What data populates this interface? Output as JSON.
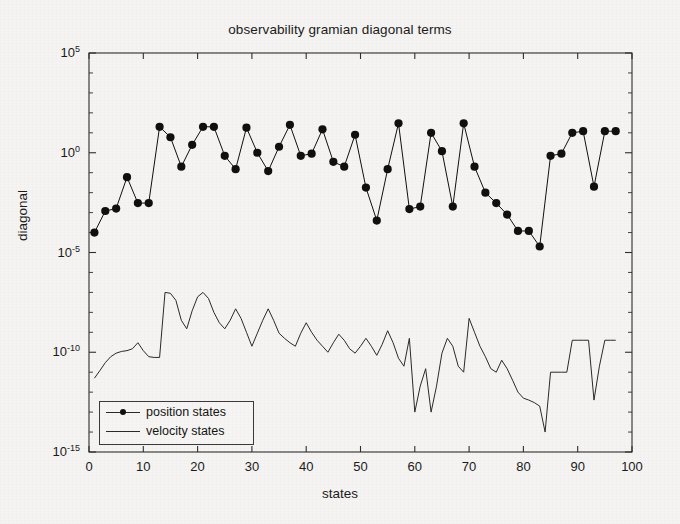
{
  "chart_data": {
    "type": "line",
    "title": "observability gramian diagonal terms",
    "xlabel": "states",
    "ylabel": "diagonal",
    "xlim": [
      0,
      100
    ],
    "ylim": [
      1e-15,
      100000.0
    ],
    "yscale": "log",
    "grid": false,
    "legend_position": "lower left",
    "xticks": [
      0,
      10,
      20,
      30,
      40,
      50,
      60,
      70,
      80,
      90,
      100
    ],
    "xtick_labels": [
      "0",
      "10",
      "20",
      "30",
      "40",
      "50",
      "60",
      "70",
      "80",
      "90",
      "100"
    ],
    "yticks": [
      100000.0,
      1.0,
      1e-05,
      1e-10,
      1e-15
    ],
    "ytick_labels": [
      "10^5",
      "10^0",
      "10^-5",
      "10^-10",
      "10^-15"
    ],
    "ytick_mantissa": [
      "10",
      "10",
      "10",
      "10",
      "10"
    ],
    "ytick_exponent": [
      "5",
      "0",
      "-5",
      "-10",
      "-15"
    ],
    "series": [
      {
        "name": "position states",
        "style": "line-with-markers",
        "marker": "filled-circle",
        "color": "#101010",
        "x": [
          1,
          3,
          5,
          7,
          9,
          11,
          13,
          15,
          17,
          19,
          21,
          23,
          25,
          27,
          29,
          31,
          33,
          35,
          37,
          39,
          41,
          43,
          45,
          47,
          49,
          51,
          53,
          55,
          57,
          59,
          61,
          63,
          65,
          67,
          69,
          71,
          73,
          75,
          77,
          79,
          81,
          83,
          85,
          87,
          89,
          91,
          93,
          95,
          97
        ],
        "y": [
          0.0001,
          0.0012,
          0.0016,
          0.06,
          0.003,
          0.003,
          20.0,
          6.0,
          0.2,
          2.5,
          20.0,
          20.0,
          0.7,
          0.15,
          18.0,
          1.0,
          0.12,
          2.0,
          25.0,
          0.7,
          0.9,
          15.0,
          0.35,
          0.2,
          8.0,
          0.018,
          0.0004,
          0.15,
          30.0,
          0.0015,
          0.002,
          10.0,
          1.2,
          0.002,
          30.0,
          0.2,
          0.01,
          0.003,
          0.0008,
          0.00012,
          0.00012,
          2e-05,
          0.7,
          0.9,
          10.0,
          12.0,
          0.02,
          12.0,
          12.0
        ],
        "legend_label": "position states"
      },
      {
        "name": "velocity states",
        "style": "line",
        "marker": "none",
        "color": "#2a2a2a",
        "x": [
          1,
          2,
          3,
          4,
          5,
          6,
          7,
          8,
          9,
          10,
          11,
          12,
          13,
          14,
          15,
          16,
          17,
          18,
          19,
          20,
          21,
          22,
          23,
          24,
          25,
          26,
          27,
          28,
          29,
          30,
          31,
          32,
          33,
          34,
          35,
          36,
          37,
          38,
          39,
          40,
          41,
          42,
          43,
          44,
          45,
          46,
          47,
          48,
          49,
          50,
          51,
          52,
          53,
          54,
          55,
          56,
          57,
          58,
          59,
          60,
          61,
          62,
          63,
          64,
          65,
          66,
          67,
          68,
          69,
          70,
          71,
          72,
          73,
          74,
          75,
          76,
          77,
          78,
          79,
          80,
          81,
          82,
          83,
          84,
          85,
          86,
          87,
          88,
          89,
          90,
          91,
          92,
          93,
          94,
          95,
          96,
          97
        ],
        "y": [
          5e-12,
          1.2e-11,
          3e-11,
          6e-11,
          9e-11,
          1.1e-10,
          1.2e-10,
          1.5e-10,
          3e-10,
          1.2e-10,
          6e-11,
          5.5e-11,
          5.5e-11,
          1e-07,
          9e-08,
          4e-08,
          4e-09,
          1.5e-09,
          1.2e-08,
          6e-08,
          1e-07,
          5e-08,
          1e-08,
          3e-09,
          1.5e-09,
          4e-09,
          1.5e-08,
          5e-09,
          1e-09,
          2e-10,
          9e-10,
          4e-09,
          1.5e-08,
          4e-09,
          9e-10,
          5e-10,
          3e-10,
          2e-10,
          9e-10,
          3e-09,
          1e-09,
          4e-10,
          2e-10,
          1e-10,
          3e-10,
          8e-10,
          4e-10,
          1.5e-10,
          9e-11,
          2e-10,
          5e-10,
          2e-10,
          7e-11,
          2.5e-10,
          1.2e-09,
          3e-10,
          5e-11,
          2e-11,
          5e-10,
          1e-13,
          2e-12,
          1.5e-11,
          1e-13,
          2e-12,
          9e-11,
          5e-10,
          2e-10,
          2e-11,
          1e-11,
          5e-09,
          1e-09,
          2e-10,
          6e-11,
          1.5e-11,
          1e-11,
          4e-11,
          1.5e-11,
          4e-12,
          1e-12,
          5e-13,
          4e-13,
          3e-13,
          2e-13,
          1e-14,
          1e-11,
          1e-11,
          1e-11,
          1e-11,
          4e-10,
          4e-10,
          4e-10,
          4e-10,
          4e-13,
          2e-11,
          4e-10,
          4e-10,
          4e-10
        ],
        "legend_label": "velocity states"
      }
    ]
  },
  "legend": {
    "items": [
      {
        "label": "position states",
        "icon": "line-with-dot-marker"
      },
      {
        "label": "velocity states",
        "icon": "plain-line"
      }
    ]
  },
  "colors": {
    "axis": "#2e2e2e",
    "marker": "#101010",
    "line": "#2a2a2a",
    "background": "#f5f4f2",
    "text": "#1b1b1b"
  }
}
